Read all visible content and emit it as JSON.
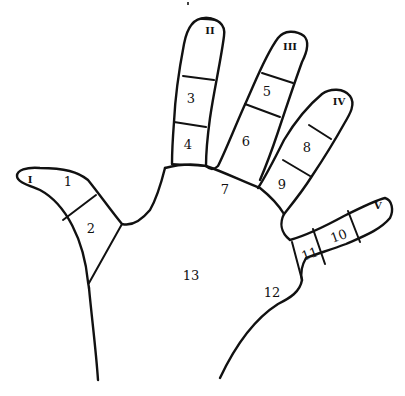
{
  "diagram": {
    "title": "",
    "colors": {
      "line": "#111111",
      "background": "#ffffff"
    },
    "finger_labels": [
      {
        "id": "I",
        "label": "I",
        "x": 30,
        "y": 180
      },
      {
        "id": "II",
        "label": "II",
        "x": 210,
        "y": 31
      },
      {
        "id": "III",
        "label": "III",
        "x": 290,
        "y": 47
      },
      {
        "id": "IV",
        "label": "IV",
        "x": 339,
        "y": 102
      },
      {
        "id": "V",
        "label": "V",
        "x": 378,
        "y": 206
      }
    ],
    "regions": [
      {
        "id": "1",
        "label": "1",
        "x": 68,
        "y": 182
      },
      {
        "id": "2",
        "label": "2",
        "x": 91,
        "y": 229
      },
      {
        "id": "3",
        "label": "3",
        "x": 191,
        "y": 99
      },
      {
        "id": "4",
        "label": "4",
        "x": 188,
        "y": 145
      },
      {
        "id": "5",
        "label": "5",
        "x": 267,
        "y": 92
      },
      {
        "id": "6",
        "label": "6",
        "x": 246,
        "y": 142
      },
      {
        "id": "7",
        "label": "7",
        "x": 225,
        "y": 190
      },
      {
        "id": "8",
        "label": "8",
        "x": 307,
        "y": 148
      },
      {
        "id": "9",
        "label": "9",
        "x": 282,
        "y": 185
      },
      {
        "id": "10",
        "label": "10",
        "x": 339,
        "y": 237
      },
      {
        "id": "11",
        "label": "11",
        "x": 310,
        "y": 255
      },
      {
        "id": "12",
        "label": "12",
        "x": 272,
        "y": 293
      },
      {
        "id": "13",
        "label": "13",
        "x": 191,
        "y": 276
      }
    ]
  }
}
